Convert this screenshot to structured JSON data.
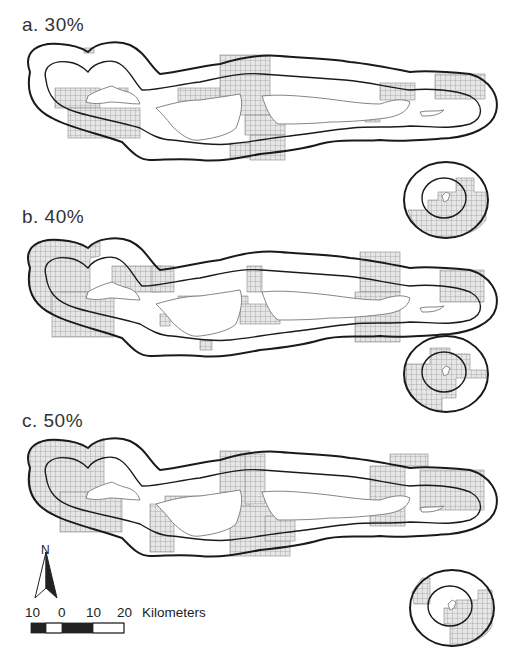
{
  "figure": {
    "panels": [
      {
        "id": "a",
        "label": "a.  30%",
        "threshold_percent": 30
      },
      {
        "id": "b",
        "label": "b.  40%",
        "threshold_percent": 40
      },
      {
        "id": "c",
        "label": "c.  50%",
        "threshold_percent": 50
      }
    ],
    "north_arrow": {
      "label": "N"
    },
    "scale_bar": {
      "ticks": [
        "10",
        "0",
        "10",
        "20"
      ],
      "units": "Kilometers"
    },
    "colors": {
      "buffer_line": "#1a1a1a",
      "island_line": "#777777",
      "grid_fill": "#e6e6e6",
      "grid_line": "#8a8a8a",
      "background": "#ffffff"
    }
  }
}
